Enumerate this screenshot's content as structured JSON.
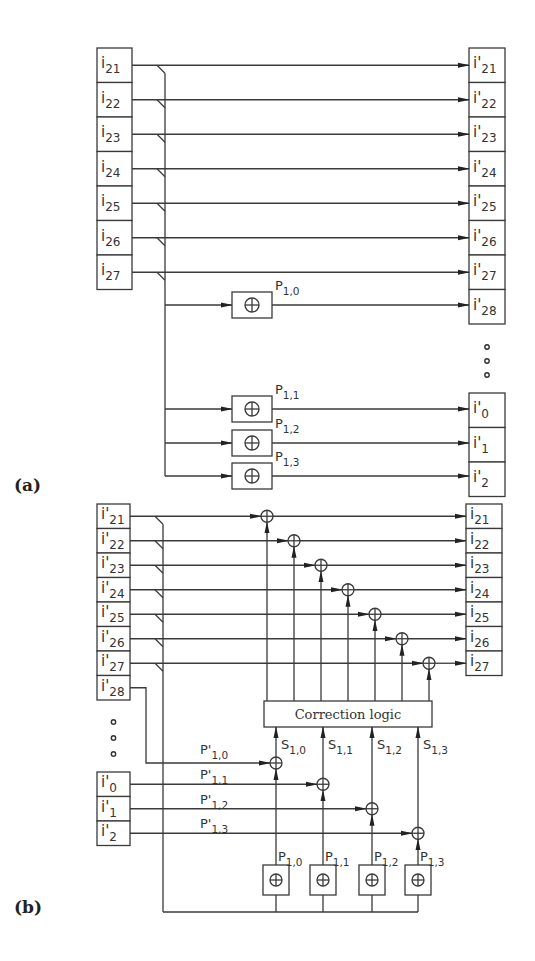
{
  "figure": {
    "panels": [
      {
        "id": "a",
        "label": "(a)",
        "inputs": [
          {
            "base": "i",
            "prime": false,
            "sub": "21"
          },
          {
            "base": "i",
            "prime": false,
            "sub": "22"
          },
          {
            "base": "i",
            "prime": false,
            "sub": "23"
          },
          {
            "base": "i",
            "prime": false,
            "sub": "24"
          },
          {
            "base": "i",
            "prime": false,
            "sub": "25"
          },
          {
            "base": "i",
            "prime": false,
            "sub": "26"
          },
          {
            "base": "i",
            "prime": false,
            "sub": "27"
          }
        ],
        "outputs_top": [
          {
            "base": "i'",
            "sub": "21"
          },
          {
            "base": "i'",
            "sub": "22"
          },
          {
            "base": "i'",
            "sub": "23"
          },
          {
            "base": "i'",
            "sub": "24"
          },
          {
            "base": "i'",
            "sub": "25"
          },
          {
            "base": "i'",
            "sub": "26"
          },
          {
            "base": "i'",
            "sub": "27"
          },
          {
            "base": "i'",
            "sub": "28"
          }
        ],
        "outputs_bottom": [
          {
            "base": "i'",
            "sub": "0"
          },
          {
            "base": "i'",
            "sub": "1"
          },
          {
            "base": "i'",
            "sub": "2"
          }
        ],
        "xor_gates": [
          {
            "symbol": "⊕",
            "label": "P",
            "sub": "1,0"
          },
          {
            "symbol": "⊕",
            "label": "P",
            "sub": "1,1"
          },
          {
            "symbol": "⊕",
            "label": "P",
            "sub": "1,2"
          },
          {
            "symbol": "⊕",
            "label": "P",
            "sub": "1,3"
          }
        ],
        "ellipsis": "∘ ∘ ∘"
      },
      {
        "id": "b",
        "label": "(b)",
        "inputs_top": [
          {
            "base": "i'",
            "sub": "21"
          },
          {
            "base": "i'",
            "sub": "22"
          },
          {
            "base": "i'",
            "sub": "23"
          },
          {
            "base": "i'",
            "sub": "24"
          },
          {
            "base": "i'",
            "sub": "25"
          },
          {
            "base": "i'",
            "sub": "26"
          },
          {
            "base": "i'",
            "sub": "27"
          },
          {
            "base": "i'",
            "sub": "28"
          }
        ],
        "inputs_bottom": [
          {
            "base": "i'",
            "sub": "0"
          },
          {
            "base": "i'",
            "sub": "1"
          },
          {
            "base": "i'",
            "sub": "2"
          }
        ],
        "outputs": [
          {
            "base": "i",
            "sub": "21"
          },
          {
            "base": "i",
            "sub": "22"
          },
          {
            "base": "i",
            "sub": "23"
          },
          {
            "base": "i",
            "sub": "24"
          },
          {
            "base": "i",
            "sub": "25"
          },
          {
            "base": "i",
            "sub": "26"
          },
          {
            "base": "i",
            "sub": "27"
          }
        ],
        "received_parity_labels": [
          {
            "label": "P'",
            "sub": "1,0"
          },
          {
            "label": "P'",
            "sub": "1,1"
          },
          {
            "label": "P'",
            "sub": "1,2"
          },
          {
            "label": "P'",
            "sub": "1,3"
          }
        ],
        "syndrome_labels": [
          {
            "label": "S",
            "sub": "1,0"
          },
          {
            "label": "S",
            "sub": "1,1"
          },
          {
            "label": "S",
            "sub": "1,2"
          },
          {
            "label": "S",
            "sub": "1,3"
          }
        ],
        "recomputed_parity_labels": [
          {
            "label": "P",
            "sub": "1,0"
          },
          {
            "label": "P",
            "sub": "1,1"
          },
          {
            "label": "P",
            "sub": "1,2"
          },
          {
            "label": "P",
            "sub": "1,3"
          }
        ],
        "correction_block": "Correction logic",
        "xor_symbol": "⊕",
        "ellipsis": "∘ ∘ ∘"
      }
    ]
  }
}
